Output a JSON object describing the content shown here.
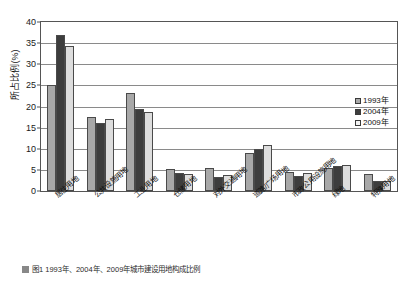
{
  "chart_data": {
    "type": "bar",
    "title": "",
    "xlabel": "",
    "ylabel": "所占比例(%)",
    "ylim": [
      0,
      40
    ],
    "yticks": [
      0,
      5,
      10,
      15,
      20,
      25,
      30,
      35,
      40
    ],
    "grid": true,
    "legend_position": "right",
    "categories": [
      "居住用地",
      "公共设施用地",
      "工业用地",
      "仓储用地",
      "对外交通用地",
      "道路/广场用地",
      "市政公用设施用地",
      "绿地",
      "特殊用地"
    ],
    "series": [
      {
        "name": "1993年",
        "color": "#a8a8a8",
        "values": [
          25.0,
          17.5,
          23.2,
          5.2,
          5.4,
          9.1,
          4.6,
          5.4,
          4.1
        ]
      },
      {
        "name": "2004年",
        "color": "#3d3d3d",
        "values": [
          37.0,
          16.2,
          19.3,
          4.2,
          3.3,
          10.0,
          3.6,
          6.0,
          2.4
        ]
      },
      {
        "name": "2009年",
        "color": "#dddddd",
        "values": [
          34.3,
          17.0,
          18.7,
          4.1,
          3.7,
          11.0,
          4.2,
          6.1,
          2.3
        ]
      }
    ]
  },
  "legend": {
    "items": [
      {
        "label": "1993年"
      },
      {
        "label": "2004年"
      },
      {
        "label": "2009年"
      }
    ]
  },
  "caption": {
    "text": "图1  1993年、2004年、2009年城市建设用地构成比例"
  }
}
